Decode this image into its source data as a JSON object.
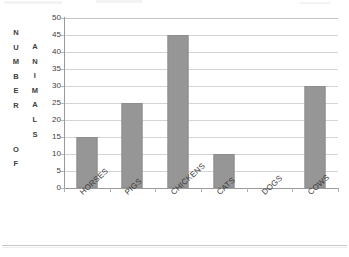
{
  "chart_data": {
    "type": "bar",
    "title": "",
    "subtitle": "",
    "xlabel": "ANIMALS",
    "ylabel": "NUMBER OF",
    "ylabel_stack": [
      "N",
      "U",
      "M",
      "B",
      "E",
      "R",
      "",
      "",
      "O",
      "F"
    ],
    "xlabel_stack": [
      "A",
      "N",
      "I",
      "M",
      "A",
      "L",
      "S"
    ],
    "categories": [
      "HORSES",
      "PIGS",
      "CHICKENS",
      "CATS",
      "DOGS",
      "COWS"
    ],
    "values": [
      15,
      25,
      45,
      10,
      0,
      30
    ],
    "ylim": [
      0,
      50
    ],
    "ytick_step": 5,
    "yticks": [
      50,
      45,
      40,
      35,
      30,
      25,
      20,
      15,
      10,
      5,
      0
    ],
    "grid": true,
    "legend": "none",
    "bar_color": "#969696",
    "grid_color": "#d4d4d4",
    "axis_color": "#9a9a9a",
    "label_rotation_deg": -42
  }
}
